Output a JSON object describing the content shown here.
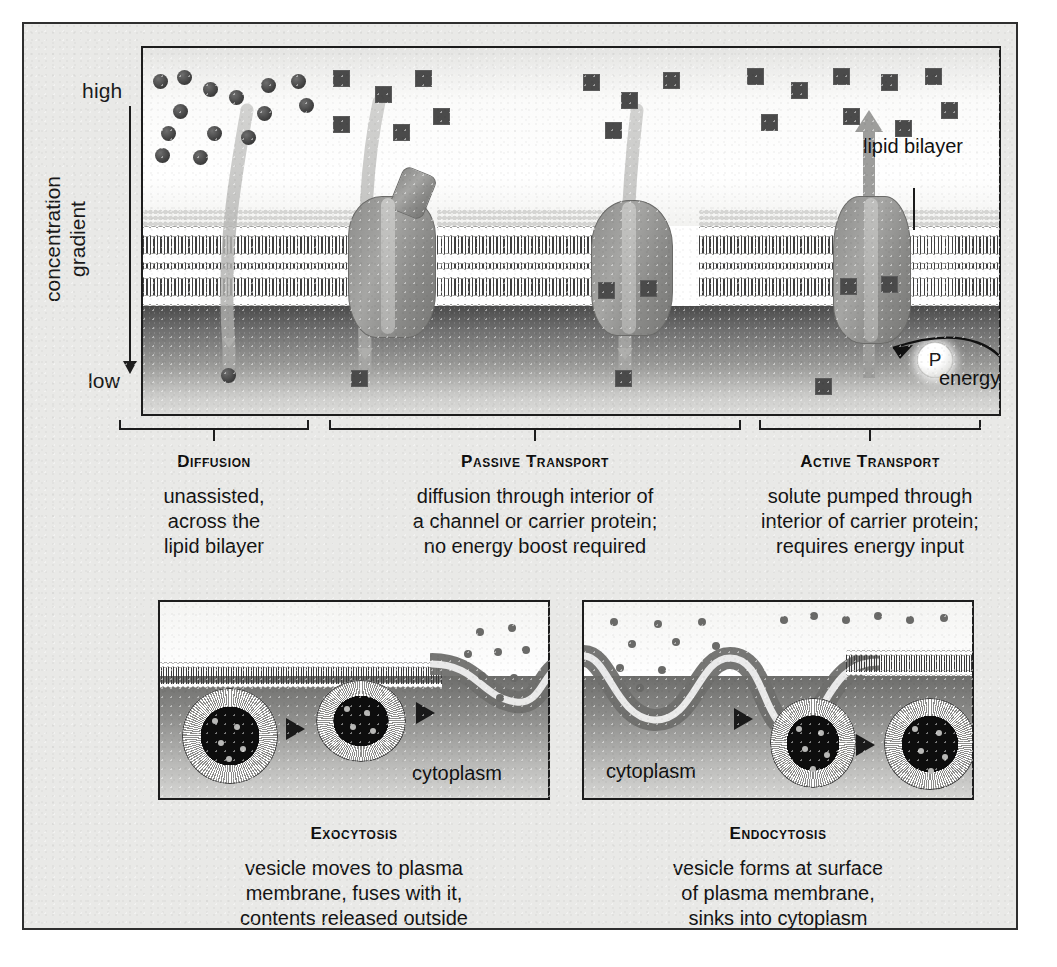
{
  "figure": {
    "gradient_axis": {
      "high_label": "high",
      "low_label": "low",
      "caption": "concentration gradient"
    },
    "top_panel_labels": {
      "lipid_bilayer": "lipid bilayer",
      "energy_input": "energy input",
      "phosphate": "P"
    },
    "mechanisms": [
      {
        "title": "Diffusion",
        "lines": [
          "unassisted,",
          "across the",
          "lipid bilayer"
        ]
      },
      {
        "title": "Passive Transport",
        "lines": [
          "diffusion through interior of",
          "a channel or carrier protein;",
          "no energy boost required"
        ]
      },
      {
        "title": "Active Transport",
        "lines": [
          "solute pumped through",
          "interior of carrier protein;",
          "requires energy input"
        ]
      }
    ],
    "vesicle_panels": [
      {
        "title": "Exocytosis",
        "inner_label": "cytoplasm",
        "lines": [
          "vesicle moves to plasma",
          "membrane, fuses with it,",
          "contents released outside"
        ]
      },
      {
        "title": "Endocytosis",
        "inner_label": "cytoplasm",
        "lines": [
          "vesicle forms at surface",
          "of plasma membrane,",
          "sinks into cytoplasm"
        ]
      }
    ],
    "colors": {
      "plate_background": "#e9e9e7",
      "border": "#1d1d1d",
      "solute_square": "#4a4a4a",
      "solute_circle": "#3c3c3c",
      "protein": "#9a9a98",
      "cytoplasm": "#6f6f6f",
      "text": "#141414"
    }
  }
}
